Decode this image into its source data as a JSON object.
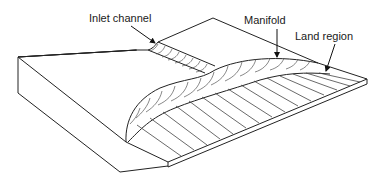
{
  "diagram": {
    "type": "isometric die schematic",
    "labels": [
      {
        "id": "inlet",
        "text": "Inlet channel",
        "x": 89,
        "y": 12
      },
      {
        "id": "manifold",
        "text": "Manifold",
        "x": 244,
        "y": 14
      },
      {
        "id": "land",
        "text": "Land region",
        "x": 295,
        "y": 30
      }
    ],
    "colors": {
      "line": "#222222",
      "background": "#ffffff"
    }
  }
}
